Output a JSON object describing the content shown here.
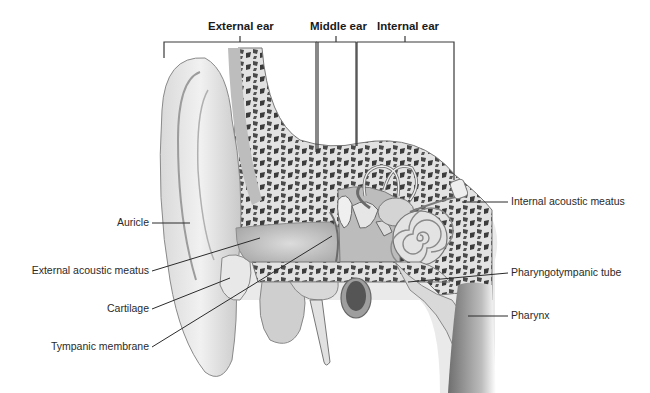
{
  "diagram": {
    "regions": [
      {
        "id": "external",
        "label": "External ear",
        "x1": 164,
        "x2": 316,
        "tick": 240
      },
      {
        "id": "middle",
        "label": "Middle ear",
        "x1": 316,
        "x2": 356,
        "tick": 336
      },
      {
        "id": "internal",
        "label": "Internal ear",
        "x1": 357,
        "x2": 454,
        "tick": 405
      }
    ],
    "callouts_left": [
      {
        "label": "Auricle",
        "text_right": 149,
        "y": 223
      },
      {
        "label": "External acoustic meatus",
        "text_right": 149,
        "y": 271
      },
      {
        "label": "Cartilage",
        "text_right": 149,
        "y": 309
      },
      {
        "label": "Tympanic membrane",
        "text_right": 149,
        "y": 347
      }
    ],
    "callouts_right": [
      {
        "label": "Internal acoustic meatus",
        "text_left": 511,
        "y": 202
      },
      {
        "label": "Pharyngotympanic tube",
        "text_left": 511,
        "y": 273
      },
      {
        "label": "Pharynx",
        "text_left": 511,
        "y": 316
      }
    ]
  },
  "colors": {
    "background": "#ffffff",
    "leader_lines": "#2b2b2b",
    "bone_light": "#e6e6e6",
    "bone_dark": "#6e6e6e",
    "tissue": "#cfcfcf"
  }
}
